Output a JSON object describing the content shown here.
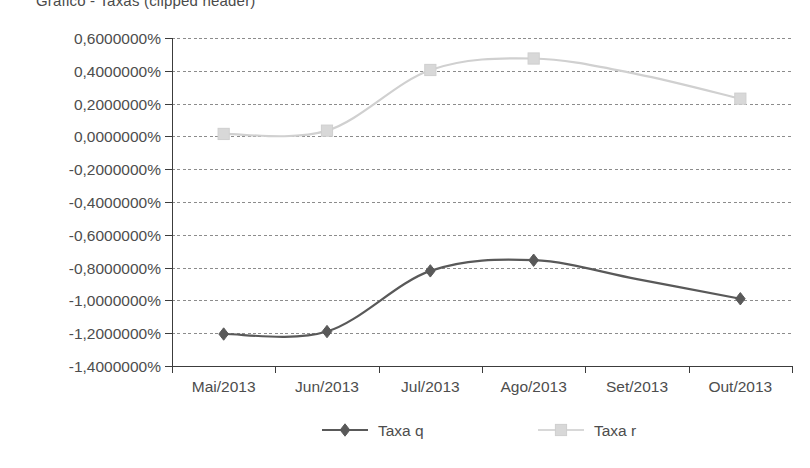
{
  "title": {
    "text": "Gráfico - Taxas (clipped header)",
    "visible_partial": true
  },
  "chart_data": {
    "type": "line",
    "title": "",
    "xlabel": "",
    "ylabel": "",
    "categories": [
      "Mai/2013",
      "Jun/2013",
      "Jul/2013",
      "Ago/2013",
      "Set/2013",
      "Out/2013"
    ],
    "series": [
      {
        "name": "Taxa q",
        "color": "#595959",
        "marker": "diamond",
        "values": [
          -1.205,
          -1.19,
          -0.82,
          -0.755,
          -0.87,
          -0.99
        ],
        "markers_shown": [
          true,
          true,
          true,
          true,
          false,
          true
        ]
      },
      {
        "name": "Taxa r",
        "color": "#d8d8d8",
        "marker": "square",
        "values": [
          0.015,
          0.035,
          0.405,
          0.475,
          0.38,
          0.23
        ],
        "markers_shown": [
          true,
          true,
          true,
          true,
          false,
          true
        ]
      }
    ],
    "ylim": [
      -1.4,
      0.6
    ],
    "ytick_values": [
      0.6,
      0.4,
      0.2,
      0.0,
      -0.2,
      -0.4,
      -0.6,
      -0.8,
      -1.0,
      -1.2,
      -1.4
    ],
    "ytick_labels": [
      "0,6000000%",
      "0,4000000%",
      "0,2000000%",
      "0,0000000%",
      "-0,2000000%",
      "-0,4000000%",
      "-0,6000000%",
      "-0,8000000%",
      "-1,0000000%",
      "-1,2000000%",
      "-1,4000000%"
    ],
    "xtick_labels": [
      "Mai/2013",
      "Jun/2013",
      "Jul/2013",
      "Ago/2013",
      "Set/2013",
      "Out/2013"
    ],
    "grid": true,
    "grid_style": "dashed-horizontal",
    "smoothing": "spline",
    "legend_position": "bottom-center",
    "legend": [
      {
        "label": "Taxa q",
        "color": "#595959",
        "marker": "diamond"
      },
      {
        "label": "Taxa r",
        "color": "#d8d8d8",
        "marker": "square"
      }
    ]
  }
}
